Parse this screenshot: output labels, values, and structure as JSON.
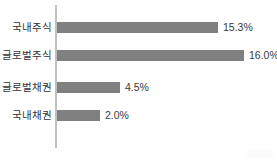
{
  "chart_data": {
    "type": "bar",
    "orientation": "horizontal",
    "title": "",
    "subtitle": "",
    "xlabel": "",
    "ylabel": "",
    "grid": false,
    "legend": null,
    "axis_line_color": "#c0c0c0",
    "bar_color": "#808080",
    "background_color": "#ffffff",
    "categories": [
      "국내주식",
      "글로벌주식",
      "글로벌채권",
      "국내채권"
    ],
    "values": [
      15.3,
      16.0,
      4.5,
      2.0
    ],
    "value_labels": [
      "15.3%",
      "16.0%",
      "4.5%",
      "2.0%"
    ],
    "value_unit": "%",
    "xlim": [
      0,
      16.0
    ],
    "bars": [
      {
        "category": "국내주식",
        "value": 15.3,
        "label": "15.3%",
        "pixel_width": 161
      },
      {
        "category": "글로벌주식",
        "value": 16.0,
        "label": "16.0%",
        "pixel_width": 187
      },
      {
        "category": "글로벌채권",
        "value": 4.5,
        "label": "4.5%",
        "pixel_width": 63
      },
      {
        "category": "국내채권",
        "value": 2.0,
        "label": "2.0%",
        "pixel_width": 43
      }
    ]
  }
}
